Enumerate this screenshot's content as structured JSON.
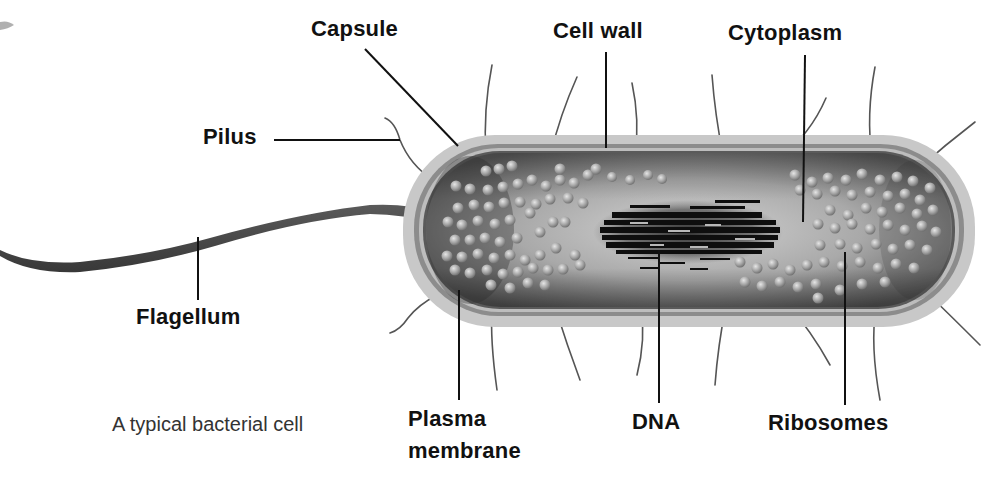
{
  "diagram": {
    "title": "A typical bacterial cell",
    "caption": "A typical bacterial cell",
    "colors": {
      "background": "#ffffff",
      "capsule": "#c9c9c9",
      "cell_wall": "#8a8a8a",
      "membrane": "#b5b5b5",
      "cytoplasm": "#9a9a9a",
      "cytoplasm_light": "#cfcfcf",
      "dna": "#111111",
      "ribosome": "#a8a8a8",
      "flagellum": "#4a4a4a",
      "pili": "#555555",
      "leader_line": "#111111",
      "label_text": "#111111"
    },
    "labels": {
      "capsule": "Capsule",
      "cell_wall": "Cell wall",
      "cytoplasm": "Cytoplasm",
      "pilus": "Pilus",
      "flagellum": "Flagellum",
      "plasma_membrane_line1": "Plasma",
      "plasma_membrane_line2": "membrane",
      "dna": "DNA",
      "ribosomes": "Ribosomes"
    },
    "structures": [
      {
        "id": "capsule",
        "label": "Capsule"
      },
      {
        "id": "cell-wall",
        "label": "Cell wall"
      },
      {
        "id": "cytoplasm",
        "label": "Cytoplasm"
      },
      {
        "id": "pilus",
        "label": "Pilus"
      },
      {
        "id": "flagellum",
        "label": "Flagellum"
      },
      {
        "id": "plasma-membrane",
        "label": "Plasma membrane"
      },
      {
        "id": "dna",
        "label": "DNA"
      },
      {
        "id": "ribosomes",
        "label": "Ribosomes"
      }
    ]
  }
}
